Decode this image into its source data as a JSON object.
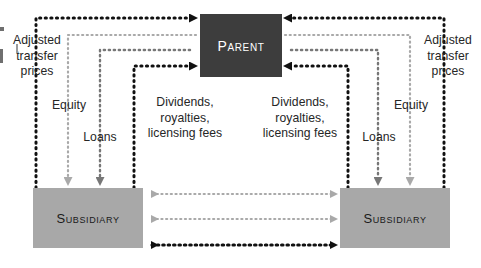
{
  "diagram": {
    "nodes": {
      "parent": {
        "label": "Parent",
        "fill": "#3d3d3d",
        "text_color": "#ffffff"
      },
      "subsidiary_left": {
        "label": "Subsidiary",
        "fill": "#a8a8a8",
        "text_color": "#1a1a1a"
      },
      "subsidiary_right": {
        "label": "Subsidiary",
        "fill": "#a8a8a8",
        "text_color": "#1a1a1a"
      }
    },
    "labels": {
      "adjusted_transfer_prices_left": "Adjusted\ntransfer\nprices",
      "equity_left": "Equity",
      "loans_left": "Loans",
      "dividends_left": "Dividends,\nroyalties,\nlicensing fees",
      "dividends_right": "Dividends,\nroyalties,\nlicensing fees",
      "loans_right": "Loans",
      "equity_right": "Equity",
      "adjusted_transfer_prices_right": "Adjusted\ntransfer\nprices"
    },
    "colors": {
      "flow_black": "#111111",
      "flow_dark_gray": "#777777",
      "flow_light_gray": "#a9a9a9",
      "parent_fill": "#3d3d3d",
      "subsidiary_fill": "#a8a8a8",
      "background": "#ffffff"
    },
    "flows": [
      {
        "name": "adjusted-transfer-prices-left",
        "from": "subsidiary_left",
        "to": "parent",
        "color": "#111111",
        "label": "Adjusted transfer prices"
      },
      {
        "name": "equity-left",
        "from": "parent",
        "to": "subsidiary_left",
        "color": "#a9a9a9",
        "label": "Equity"
      },
      {
        "name": "loans-left",
        "from": "parent",
        "to": "subsidiary_left",
        "color": "#777777",
        "label": "Loans"
      },
      {
        "name": "dividends-left",
        "from": "subsidiary_left",
        "to": "parent",
        "color": "#111111",
        "label": "Dividends, royalties, licensing fees"
      },
      {
        "name": "dividends-right",
        "from": "subsidiary_right",
        "to": "parent",
        "color": "#111111",
        "label": "Dividends, royalties, licensing fees"
      },
      {
        "name": "loans-right",
        "from": "parent",
        "to": "subsidiary_right",
        "color": "#777777",
        "label": "Loans"
      },
      {
        "name": "equity-right",
        "from": "parent",
        "to": "subsidiary_right",
        "color": "#a9a9a9",
        "label": "Equity"
      },
      {
        "name": "adjusted-transfer-prices-right",
        "from": "subsidiary_right",
        "to": "parent",
        "color": "#111111",
        "label": "Adjusted transfer prices"
      },
      {
        "name": "intersubsidiary-top",
        "from": "subsidiary_left",
        "to": "subsidiary_right",
        "color": "#a9a9a9",
        "bidirectional": true
      },
      {
        "name": "intersubsidiary-middle",
        "from": "subsidiary_left",
        "to": "subsidiary_right",
        "color": "#a9a9a9",
        "bidirectional": true
      },
      {
        "name": "intersubsidiary-bottom",
        "from": "subsidiary_left",
        "to": "subsidiary_right",
        "color": "#111111",
        "bidirectional": true
      }
    ]
  }
}
